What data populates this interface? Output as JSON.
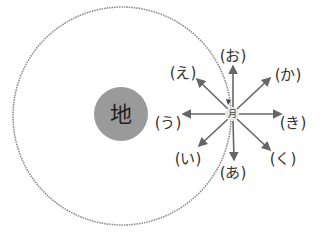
{
  "diagram": {
    "earth": {
      "label": "地",
      "color": "#9a9a9a",
      "cx": 121,
      "cy": 114,
      "r": 27
    },
    "moon": {
      "label": "月",
      "color": "#e8e8e8",
      "cx": 232,
      "cy": 114,
      "r": 7
    },
    "orbit": {
      "cx": 122,
      "cy": 116,
      "r": 109,
      "style": "dotted",
      "color": "#888888"
    },
    "arrow_color": "#666666",
    "directions": [
      {
        "id": "a",
        "label": "(あ)"
      },
      {
        "id": "i",
        "label": "(い)"
      },
      {
        "id": "u",
        "label": "(う)"
      },
      {
        "id": "e",
        "label": "(え)"
      },
      {
        "id": "o",
        "label": "(お)"
      },
      {
        "id": "ka",
        "label": "(か)"
      },
      {
        "id": "ki",
        "label": "(き)"
      },
      {
        "id": "ku",
        "label": "(く)"
      }
    ]
  }
}
